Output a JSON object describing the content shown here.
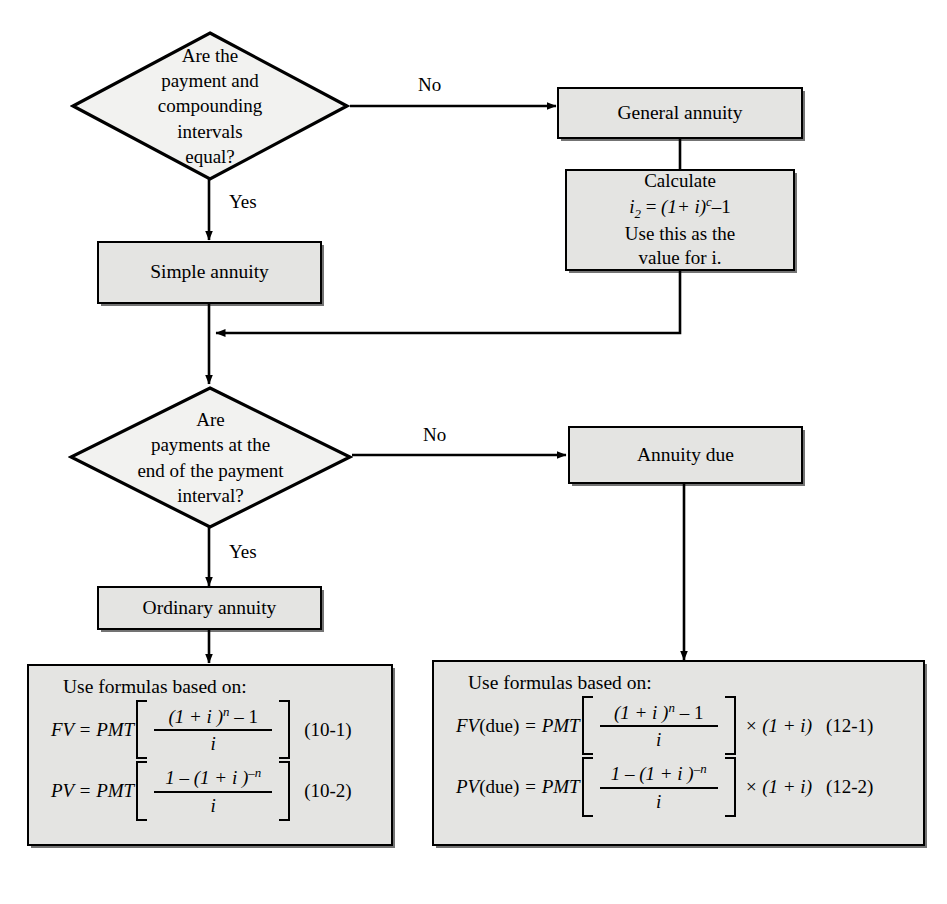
{
  "diagram": {
    "colors": {
      "node_fill": "#e4e4e2",
      "node_border": "#000000",
      "page_background": "#ffffff",
      "text": "#000000"
    },
    "nodes": {
      "decision1": {
        "type": "decision",
        "text": "Are the\npayment and\ncompounding\nintervals\nequal?"
      },
      "general_annuity": {
        "type": "process",
        "label": "General annuity"
      },
      "calculate": {
        "type": "process",
        "line1": "Calculate",
        "formula_lhs": "i",
        "formula_sub": "2",
        "formula_eq": " = ",
        "formula_rhs_base": "(1+ i)",
        "formula_exp": "c",
        "formula_minus": "–1",
        "line3": "Use this as the",
        "line4": "value for i."
      },
      "simple_annuity": {
        "type": "process",
        "label": "Simple annuity"
      },
      "decision2": {
        "type": "decision",
        "text": "Are\npayments at the\nend of the payment\ninterval?"
      },
      "annuity_due": {
        "type": "process",
        "label": "Annuity due"
      },
      "ordinary_annuity": {
        "type": "process",
        "label": "Ordinary annuity"
      },
      "ordinary_formulas": {
        "type": "formula-box",
        "heading": "Use formulas based on:",
        "rows": [
          {
            "lhs": "FV = PMT",
            "numerator": "(1 + i )",
            "numerator_exp": "n",
            "numerator_tail": " – 1",
            "denominator": "i",
            "tail": "",
            "eqnum": "(10-1)"
          },
          {
            "lhs": "PV = PMT",
            "numerator": "1 – (1 + i )",
            "numerator_exp": "–n",
            "numerator_tail": "",
            "denominator": "i",
            "tail": "",
            "eqnum": "(10-2)"
          }
        ]
      },
      "due_formulas": {
        "type": "formula-box",
        "heading": "Use formulas based on:",
        "rows": [
          {
            "lhs": "FV",
            "lhs_roman": "(due)",
            "lhs_rest": " = PMT",
            "numerator": "(1 + i )",
            "numerator_exp": "n",
            "numerator_tail": " – 1",
            "denominator": "i",
            "tail": "× (1 + i)",
            "eqnum": "(12-1)"
          },
          {
            "lhs": "PV",
            "lhs_roman": "(due)",
            "lhs_rest": " = PMT",
            "numerator": "1 – (1 + i )",
            "numerator_exp": "–n",
            "numerator_tail": "",
            "denominator": "i",
            "tail": "× (1 + i)",
            "eqnum": "(12-2)"
          }
        ]
      }
    },
    "edge_labels": {
      "d1_no": "No",
      "d1_yes": "Yes",
      "d2_no": "No",
      "d2_yes": "Yes"
    }
  }
}
